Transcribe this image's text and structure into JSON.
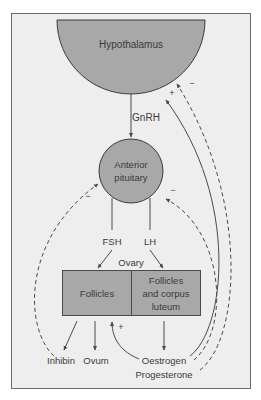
{
  "colors": {
    "background": "#ffffff",
    "panel": "#eeeeee",
    "frame": "#6a6a6a",
    "organ_fill": "#a8a8a8",
    "line": "#4a4a4a",
    "text": "#3a3a3a"
  },
  "nodes": {
    "hypothalamus": "Hypothalamus",
    "anterior_pituitary_line1": "Anterior",
    "anterior_pituitary_line2": "pituitary",
    "ovary": "Ovary",
    "follicles": "Follicles",
    "follicles_cl_line1": "Follicles",
    "follicles_cl_line2": "and corpus",
    "follicles_cl_line3": "luteum"
  },
  "hormones": {
    "gnrh": "GnRH",
    "fsh": "FSH",
    "lh": "LH",
    "inhibin": "Inhibin",
    "ovum": "Ovum",
    "oestrogen": "Oestrogen",
    "progesterone": "Progesterone"
  },
  "feedback_signs": {
    "hypothalamus_positive": "+",
    "hypothalamus_negative": "−",
    "pituitary_left_negative": "−",
    "pituitary_right_negative": "−",
    "follicles_positive": "+"
  }
}
